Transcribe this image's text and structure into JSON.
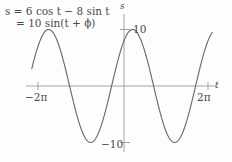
{
  "figure": {
    "background_color": "#fdfdfd",
    "ink_color": "#5a5a5a",
    "axis_color": "#9a9a9a",
    "curve_color": "#6b6b6b"
  },
  "annotations": {
    "equation_line_1": "s = 6 cos t − 8 sin t",
    "equation_line_2": "= 10 sin(t + ϕ)",
    "equation_line_1_parts": {
      "lhs": "s",
      "equals": "=",
      "term_1_coefficient": "6",
      "term_1_function": "cos",
      "term_1_variable": "t",
      "minus": "−",
      "term_2_coefficient": "8",
      "term_2_function": "sin",
      "term_2_variable": "t"
    },
    "equation_line_2_parts": {
      "equals": "=",
      "amplitude": "10",
      "function": "sin",
      "open_paren": "(",
      "variable": "t",
      "plus": "+",
      "phase": "ϕ",
      "close_paren": ")"
    }
  },
  "axes": {
    "x_axis_label": "t",
    "y_axis_label": "s",
    "x_ticks": [
      {
        "label": "−2π",
        "value": -6.283185
      },
      {
        "label": "2π",
        "value": 6.283185
      }
    ],
    "y_ticks": [
      {
        "label": "10",
        "value": 10
      },
      {
        "label": "−10",
        "value": -10
      }
    ],
    "xlim": [
      -7.6,
      7.6
    ],
    "ylim": [
      -13.0,
      13.0
    ],
    "grid": false
  },
  "chart_data": {
    "type": "line",
    "title": "",
    "subtitle": "",
    "xlabel": "t",
    "ylabel": "s",
    "xlim": [
      -7.6,
      7.6
    ],
    "ylim": [
      -13.0,
      13.0
    ],
    "grid": false,
    "legend": "none",
    "xticks": [
      -6.283185,
      6.283185
    ],
    "xticklabels": [
      "−2π",
      "2π"
    ],
    "yticks": [
      -10,
      10
    ],
    "yticklabels": [
      "−10",
      "10"
    ],
    "annotations": [
      "s = 6 cos t − 8 sin t",
      "= 10 sin(t + ϕ)"
    ],
    "series": [
      {
        "name": "s = 6 cos t − 8 sin t = 10 sin(t + ϕ)",
        "formula": "10*sin(t + 0.9272952)",
        "amplitude": 10,
        "phase_radians": 0.9272952,
        "period": 6.283185,
        "domain": [
          -6.9,
          6.6
        ],
        "x": [
          -6.9,
          -6.4,
          -5.9,
          -5.4,
          -4.9,
          -4.4,
          -3.9,
          -3.4,
          -2.9,
          -2.4,
          -1.9,
          -1.4,
          -0.9,
          -0.4,
          0.1,
          0.6,
          1.1,
          1.6,
          2.1,
          2.6,
          3.1,
          3.6,
          4.1,
          4.6,
          5.1,
          5.6,
          6.1,
          6.6
        ],
        "y": [
          5.52,
          8.53,
          9.99,
          9.73,
          7.82,
          4.62,
          0.67,
          -3.43,
          -7.02,
          -9.46,
          -10.0,
          -9.12,
          -6.85,
          -3.51,
          0.43,
          4.31,
          7.49,
          9.47,
          9.99,
          9.01,
          6.69,
          3.35,
          -0.63,
          -4.45,
          -7.61,
          -9.52,
          -9.98,
          -8.92
        ]
      }
    ]
  }
}
